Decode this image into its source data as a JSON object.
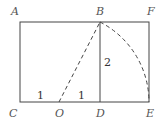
{
  "diagram": {
    "type": "geometry",
    "points": {
      "A": "A",
      "B": "B",
      "F": "F",
      "C": "C",
      "O": "O",
      "D": "D",
      "E": "E"
    },
    "segment_labels": {
      "CO": "1",
      "OD": "1",
      "BD": "2"
    },
    "colors": {
      "line": "#444444",
      "label": "#555555"
    }
  }
}
